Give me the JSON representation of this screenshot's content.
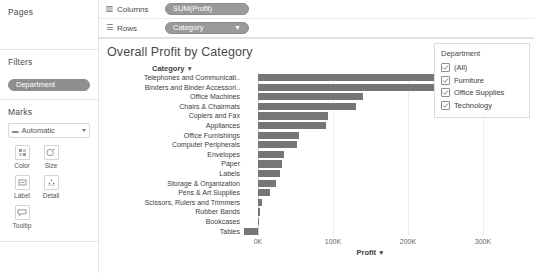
{
  "sidebar": {
    "pages": {
      "title": "Pages"
    },
    "filters": {
      "title": "Filters",
      "pills": [
        {
          "label": "Department"
        }
      ]
    },
    "marks": {
      "title": "Marks",
      "type_selector": {
        "icon": "bar-mark-icon",
        "label": "Automatic",
        "caret": "chevron-down-icon"
      },
      "buttons": [
        {
          "label": "Color",
          "icon": "color-icon"
        },
        {
          "label": "Size",
          "icon": "size-icon"
        },
        {
          "label": "Label",
          "icon": "label-icon"
        },
        {
          "label": "Detail",
          "icon": "detail-icon"
        },
        {
          "label": "Tooltip",
          "icon": "tooltip-icon"
        }
      ]
    }
  },
  "shelves": [
    {
      "name": "Columns",
      "icon": "columns-icon",
      "pill": "SUM(Profit)",
      "sort": ""
    },
    {
      "name": "Rows",
      "icon": "rows-icon",
      "pill": "Category",
      "sort": "▼"
    }
  ],
  "legend": {
    "title": "Department",
    "items": [
      {
        "label": "(All)",
        "checked": true
      },
      {
        "label": "Furniture",
        "checked": true
      },
      {
        "label": "Office Supplies",
        "checked": true
      },
      {
        "label": "Technology",
        "checked": true
      }
    ]
  },
  "colors": {
    "bar": "#767676",
    "pill": "#9a9a9a",
    "gridline": "#ececec",
    "border": "#e2e2e2"
  },
  "chart_data": {
    "type": "bar",
    "orientation": "horizontal",
    "title": "Overall Profit by Category",
    "row_header": "Category",
    "row_header_sort": "▼",
    "xlabel": "Profit",
    "xlabel_sort": "▼",
    "ylabel": "",
    "xlim": [
      -20000,
      360000
    ],
    "xticks": [
      0,
      100000,
      200000,
      300000
    ],
    "xticklabels": [
      "0K",
      "100K",
      "200K",
      "300K"
    ],
    "grid": true,
    "legend_position": "right",
    "categories": [
      "Telephones and Communicati..",
      "Binders and Binder Accessori..",
      "Office Machines",
      "Chairs & Chairmats",
      "Copiers and Fax",
      "Appliances",
      "Office Furnishings",
      "Computer Peripherals",
      "Envelopes",
      "Paper",
      "Labels",
      "Storage & Organization",
      "Pens & Art Supplies",
      "Scissors, Rulers and Trimmers",
      "Rubber Bands",
      "Bookcases",
      "Tables"
    ],
    "values": [
      338000,
      247000,
      140000,
      130000,
      94000,
      90000,
      55000,
      52000,
      34000,
      32000,
      29000,
      24000,
      16000,
      5000,
      3000,
      1000,
      -18000
    ]
  }
}
